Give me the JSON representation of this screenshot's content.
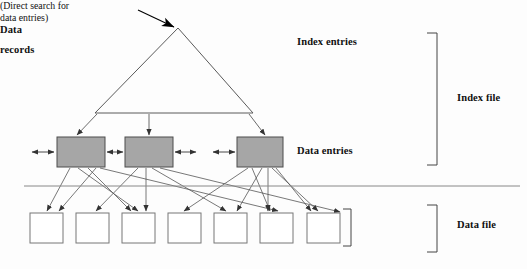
{
  "figure": {
    "type": "diagram",
    "background_color": "#fdfdfd",
    "line_color": "#555555",
    "arrow_color": "#333333",
    "node_fill_color": "#a6a6a6",
    "node_stroke_color": "#4d4d4d",
    "record_fill_color": "#ffffff",
    "record_stroke_color": "#777777",
    "text_color": "#111111"
  },
  "labels": {
    "index_entries": "Index entries",
    "direct_search_line1": "(Direct search for",
    "direct_search_line2": "data entries)",
    "data_entries": "Data entries",
    "data_records_line1": "Data",
    "data_records_line2": "records",
    "index_file": "Index file",
    "data_file": "Data file"
  },
  "structure": {
    "triangle": {
      "apex_x": 178,
      "apex_y": 28,
      "base_left_x": 95,
      "base_right_x": 253,
      "base_y": 113
    },
    "entry_arrow": {
      "from_x": 138,
      "from_y": 10,
      "to_x": 177,
      "to_y": 28
    },
    "data_entry_nodes": [
      {
        "id": "node-1",
        "x": 57,
        "y": 137,
        "w": 48,
        "h": 30
      },
      {
        "id": "node-2",
        "x": 125,
        "y": 137,
        "w": 48,
        "h": 30
      },
      {
        "id": "node-3",
        "x": 237,
        "y": 137,
        "w": 46,
        "h": 30
      }
    ],
    "data_record_nodes": [
      {
        "id": "record-1",
        "x": 30,
        "y": 213,
        "w": 33,
        "h": 30
      },
      {
        "id": "record-2",
        "x": 76,
        "y": 213,
        "w": 33,
        "h": 30
      },
      {
        "id": "record-3",
        "x": 122,
        "y": 213,
        "w": 33,
        "h": 30
      },
      {
        "id": "record-4",
        "x": 168,
        "y": 213,
        "w": 33,
        "h": 30
      },
      {
        "id": "record-5",
        "x": 214,
        "y": 213,
        "w": 33,
        "h": 30
      },
      {
        "id": "record-6",
        "x": 260,
        "y": 213,
        "w": 33,
        "h": 30
      },
      {
        "id": "record-7",
        "x": 307,
        "y": 213,
        "w": 33,
        "h": 30
      }
    ],
    "separator_line": {
      "x1": 24,
      "y1": 186,
      "x2": 520,
      "y2": 186
    },
    "brackets": [
      {
        "id": "index-file-bracket",
        "x": 437,
        "y_top": 33,
        "y_bottom": 165,
        "tick": 10
      },
      {
        "id": "data-records-bracket",
        "x": 351,
        "y_top": 209,
        "y_bottom": 246,
        "tick": 8
      },
      {
        "id": "data-file-bracket",
        "x": 437,
        "y_top": 205,
        "y_bottom": 252,
        "tick": 10
      }
    ]
  }
}
